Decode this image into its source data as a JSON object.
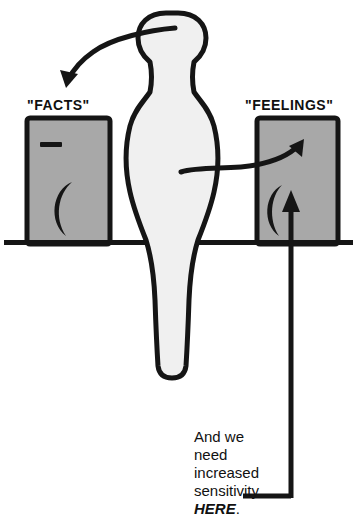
{
  "illustration": {
    "title": "Facts and Feelings cartoon diagram",
    "background_color": "#ffffff",
    "ink_color": "#151515",
    "box_fill_color": "#a8a8a8",
    "figure_fill_color": "#f0f0f0"
  },
  "labels": {
    "facts": "\"FACTS\"",
    "feelings": "\"FEELINGS\""
  },
  "caption": {
    "line1": "And we",
    "line2": "need",
    "line3": "increased",
    "line4": "sensitivity",
    "emphasis": "HERE",
    "period": "."
  },
  "elements": {
    "left_box_name": "facts-control-box",
    "right_box_name": "feelings-control-box",
    "figure_name": "human-silhouette",
    "baseline_name": "ground-line",
    "left_arrow_name": "arrow-head-to-facts",
    "right_arrow_name": "arrow-body-to-feelings",
    "pointer_name": "callout-pointer-to-feelings-dial",
    "facts_dash_name": "facts-level-dash",
    "facts_dial_name": "facts-dial-crescent",
    "feelings_dial_name": "feelings-dial-crescent",
    "feelings_up_arrow_name": "feelings-turn-up-arrow"
  }
}
